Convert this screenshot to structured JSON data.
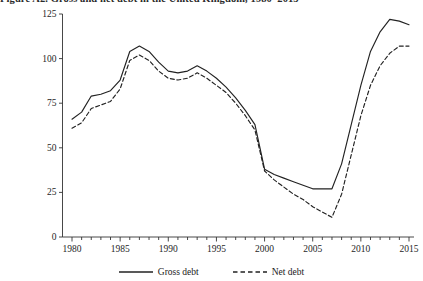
{
  "figure": {
    "caption": "Figure A2. Gross and net debt in the United Kingdom, 1980–2015"
  },
  "chart_data": {
    "type": "line",
    "title": "",
    "xlabel": "",
    "ylabel": "",
    "xlim": [
      1980,
      2015
    ],
    "ylim": [
      0,
      125
    ],
    "grid": false,
    "legend_position": "bottom",
    "y_ticks": [
      0,
      25,
      50,
      75,
      100,
      125
    ],
    "y_tick_labels": [
      "0",
      "25",
      "50",
      "75",
      "100",
      "125"
    ],
    "x_ticks": [
      1980,
      1985,
      1990,
      1995,
      2000,
      2005,
      2010,
      2015
    ],
    "x_tick_labels": [
      "1980",
      "1985",
      "1990",
      "1995",
      "2000",
      "2005",
      "2010",
      "2015"
    ],
    "x_minor_tick_interval": 1,
    "x": [
      1980,
      1981,
      1982,
      1983,
      1984,
      1985,
      1986,
      1987,
      1988,
      1989,
      1990,
      1991,
      1992,
      1993,
      1994,
      1995,
      1996,
      1997,
      1998,
      1999,
      2000,
      2001,
      2002,
      2003,
      2004,
      2005,
      2006,
      2007,
      2008,
      2009,
      2010,
      2011,
      2012,
      2013,
      2014,
      2015
    ],
    "series": [
      {
        "name": "Gross debt",
        "style": "solid",
        "color": "#222222",
        "values": [
          66,
          70,
          79,
          80,
          82,
          88,
          104,
          107,
          104,
          98,
          93,
          92,
          93,
          96,
          93,
          89,
          84,
          78,
          71,
          63,
          38,
          35,
          33,
          31,
          29,
          27,
          27,
          27,
          41,
          63,
          85,
          104,
          115,
          122,
          121,
          119
        ]
      },
      {
        "name": "Net debt",
        "style": "dashed",
        "color": "#222222",
        "values": [
          61,
          64,
          72,
          74,
          76,
          83,
          99,
          102,
          99,
          93,
          89,
          88,
          89,
          92,
          89,
          85,
          81,
          75,
          68,
          60,
          37,
          32,
          28,
          24,
          21,
          17,
          14,
          11,
          24,
          46,
          68,
          85,
          96,
          103,
          107,
          107
        ]
      }
    ]
  },
  "legend": {
    "items": [
      {
        "label": "Gross debt",
        "style": "solid"
      },
      {
        "label": "Net debt",
        "style": "dashed"
      }
    ]
  }
}
